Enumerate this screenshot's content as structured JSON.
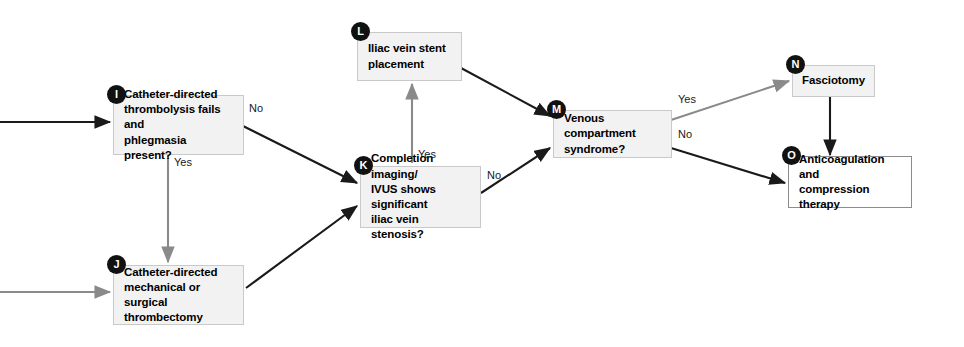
{
  "diagram": {
    "colors": {
      "node_fill": "#f2f2f2",
      "node_border": "#c9c9c9",
      "terminal_fill": "#ffffff",
      "terminal_border": "#8c8c8c",
      "arrow_primary": "#1a1a1a",
      "arrow_secondary": "#8a8a8a",
      "badge_fill": "#111111",
      "badge_text": "#ffffff",
      "background": "#ffffff"
    },
    "nodes": [
      {
        "id": "I",
        "badge": "I",
        "label": "Catheter-directed thrombolysis fails and phlegmasia present?",
        "lines": [
          "Catheter-directed",
          "thrombolysis fails and",
          "phlegmasia present?"
        ],
        "kind": "decision",
        "align": "left"
      },
      {
        "id": "J",
        "badge": "J",
        "label": "Catheter-directed mechanical or surgical thrombectomy",
        "lines": [
          "Catheter-directed",
          "mechanical or surgical",
          "thrombectomy"
        ],
        "kind": "process",
        "align": "left"
      },
      {
        "id": "K",
        "badge": "K",
        "label": "Completion imaging/ IVUS shows significant iliac vein stenosis?",
        "lines": [
          "Completion imaging/",
          "IVUS shows significant",
          "iliac vein stenosis?"
        ],
        "kind": "decision",
        "align": "left"
      },
      {
        "id": "L",
        "badge": "L",
        "label": "Iliac vein stent placement",
        "lines": [
          "Iliac vein stent",
          "placement"
        ],
        "kind": "process",
        "align": "left"
      },
      {
        "id": "M",
        "badge": "M",
        "label": "Venous compartment syndrome?",
        "lines": [
          "Venous compartment",
          "syndrome?"
        ],
        "kind": "decision",
        "align": "left"
      },
      {
        "id": "N",
        "badge": "N",
        "label": "Fasciotomy",
        "lines": [
          "Fasciotomy"
        ],
        "kind": "process",
        "align": "center"
      },
      {
        "id": "O",
        "badge": "O",
        "label": "Anticoagulation and compression therapy",
        "lines": [
          "Anticoagulation and",
          "compression therapy"
        ],
        "kind": "terminal",
        "align": "left"
      }
    ],
    "edges": [
      {
        "id": "entry-to-I",
        "from": "external",
        "to": "I",
        "label": "",
        "style": "primary"
      },
      {
        "id": "entry-to-J",
        "from": "external",
        "to": "J",
        "label": "",
        "style": "secondary"
      },
      {
        "id": "I-to-J",
        "from": "I",
        "to": "J",
        "label": "Yes",
        "style": "secondary"
      },
      {
        "id": "I-to-K",
        "from": "I",
        "to": "K",
        "label": "No",
        "style": "primary"
      },
      {
        "id": "J-to-K",
        "from": "J",
        "to": "K",
        "label": "",
        "style": "primary"
      },
      {
        "id": "K-to-L",
        "from": "K",
        "to": "L",
        "label": "Yes",
        "style": "secondary"
      },
      {
        "id": "K-to-M",
        "from": "K",
        "to": "M",
        "label": "No",
        "style": "primary"
      },
      {
        "id": "L-to-M",
        "from": "L",
        "to": "M",
        "label": "",
        "style": "primary"
      },
      {
        "id": "M-to-N",
        "from": "M",
        "to": "N",
        "label": "Yes",
        "style": "secondary"
      },
      {
        "id": "M-to-O",
        "from": "M",
        "to": "O",
        "label": "No",
        "style": "primary"
      },
      {
        "id": "N-to-O",
        "from": "N",
        "to": "O",
        "label": "",
        "style": "primary"
      }
    ],
    "edge_labels": {
      "i_yes": "Yes",
      "i_no": "No",
      "k_yes": "Yes",
      "k_no": "No",
      "m_yes": "Yes",
      "m_no": "No"
    }
  }
}
